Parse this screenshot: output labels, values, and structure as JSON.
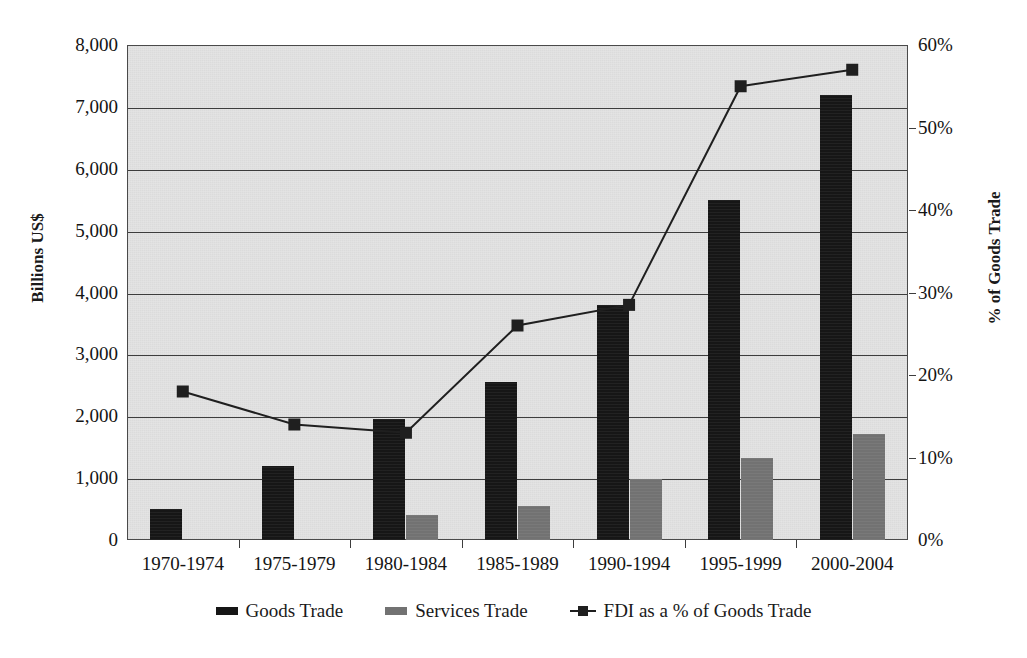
{
  "chart_data": {
    "type": "bar",
    "title": "",
    "subtitle": "",
    "categories": [
      "1970-1974",
      "1975-1979",
      "1980-1984",
      "1985-1989",
      "1990-1994",
      "1995-1999",
      "2000-2004"
    ],
    "series": [
      {
        "name": "Goods Trade",
        "axis": "left",
        "type": "bar",
        "color": "#161616",
        "values": [
          500,
          1200,
          1950,
          2550,
          3800,
          5500,
          7200
        ]
      },
      {
        "name": "Services Trade",
        "axis": "left",
        "type": "bar",
        "color": "#727272",
        "values": [
          0,
          0,
          400,
          550,
          980,
          1320,
          1720
        ]
      },
      {
        "name": "FDI as a % of Goods Trade",
        "axis": "right",
        "type": "line",
        "color": "#1f1f1f",
        "marker": "square",
        "values": [
          18,
          14,
          13,
          26,
          28.5,
          55,
          57
        ]
      }
    ],
    "xlabel": "",
    "ylabel": "Billions US$",
    "ylabel_right": "% of Goods Trade",
    "ylim": [
      0,
      8000
    ],
    "ylim_right": [
      0,
      60
    ],
    "yticks": [
      "0",
      "1,000",
      "2,000",
      "3,000",
      "4,000",
      "5,000",
      "6,000",
      "7,000",
      "8,000"
    ],
    "yticks_right": [
      "0%",
      "10%",
      "20%",
      "30%",
      "40%",
      "50%",
      "60%"
    ],
    "grid": true,
    "legend_position": "bottom",
    "plot_background": "#e3e3e3"
  },
  "axes": {
    "left_title": "Billions US$",
    "right_title": "% of Goods Trade",
    "left_ticks": [
      "8,000",
      "7,000",
      "6,000",
      "5,000",
      "4,000",
      "3,000",
      "2,000",
      "1,000",
      "0"
    ],
    "right_ticks": [
      "60%",
      "50%",
      "40%",
      "30%",
      "20%",
      "10%",
      "0%"
    ],
    "categories": [
      "1970-1974",
      "1975-1979",
      "1980-1984",
      "1985-1989",
      "1990-1994",
      "1995-1999",
      "2000-2004"
    ]
  },
  "legend": {
    "items": [
      {
        "label": "Goods Trade",
        "marker": "bar-swatch-black"
      },
      {
        "label": "Services Trade",
        "marker": "bar-swatch-gray"
      },
      {
        "label": "FDI as a % of Goods Trade",
        "marker": "line-square-marker"
      }
    ]
  },
  "watermark": {
    "text": ""
  }
}
